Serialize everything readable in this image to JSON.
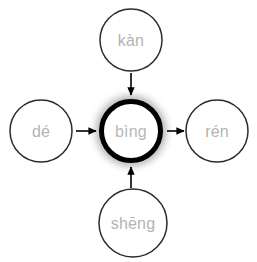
{
  "canvas": {
    "width": 257,
    "height": 262,
    "background": "#ffffff"
  },
  "style": {
    "node_outline_color": "#2b2b2b",
    "node_outline_width": 1.5,
    "center_outline_color": "#000000",
    "center_outline_width": 5,
    "center_glow_color": "#8c8c8c",
    "node_fill": "#ffffff",
    "label_color": "#b3b3b3",
    "arrow_color": "#000000",
    "label_font_size": 16
  },
  "diagram": {
    "type": "radial-network",
    "center_node": {
      "id": "bing",
      "label": "bìng",
      "cx": 131,
      "cy": 131,
      "r": 30,
      "highlighted": true
    },
    "nodes": [
      {
        "id": "kan",
        "label": "kàn",
        "position": "top",
        "cx": 131,
        "cy": 40,
        "r": 31,
        "highlighted": false
      },
      {
        "id": "de",
        "label": "dé",
        "position": "left",
        "cx": 41,
        "cy": 131,
        "r": 31,
        "highlighted": false
      },
      {
        "id": "ren",
        "label": "rén",
        "position": "right",
        "cx": 217,
        "cy": 131,
        "r": 31,
        "highlighted": false
      },
      {
        "id": "sheng",
        "label": "shēng",
        "position": "bottom",
        "cx": 133,
        "cy": 223,
        "r": 34,
        "highlighted": false
      }
    ],
    "edges": [
      {
        "id": "kan-to-bing",
        "from": "kan",
        "to": "bing",
        "direction": "down",
        "arrowhead": "to"
      },
      {
        "id": "de-to-bing",
        "from": "de",
        "to": "bing",
        "direction": "right",
        "arrowhead": "to"
      },
      {
        "id": "bing-to-ren",
        "from": "bing",
        "to": "ren",
        "direction": "right",
        "arrowhead": "to"
      },
      {
        "id": "sheng-to-bing",
        "from": "sheng",
        "to": "bing",
        "direction": "up",
        "arrowhead": "to"
      }
    ]
  }
}
